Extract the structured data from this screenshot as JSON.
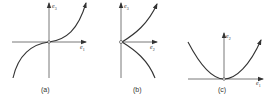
{
  "panels": [
    {
      "id": "a",
      "caption": "(a)",
      "vertical_axis": "e",
      "vertical_sub": "3",
      "horizontal_axis": "e",
      "horizontal_sub": "1",
      "curve": "cubic"
    },
    {
      "id": "b",
      "caption": "(b)",
      "vertical_axis": "e",
      "vertical_sub": "3",
      "horizontal_axis": "e",
      "horizontal_sub": "2",
      "curve": "cusp"
    },
    {
      "id": "c",
      "caption": "(c)",
      "vertical_axis": "e",
      "vertical_sub": "2",
      "horizontal_axis": "e",
      "horizontal_sub": "1",
      "curve": "parabola"
    }
  ],
  "colors": {
    "line": "#333333",
    "background": "#ffffff"
  }
}
